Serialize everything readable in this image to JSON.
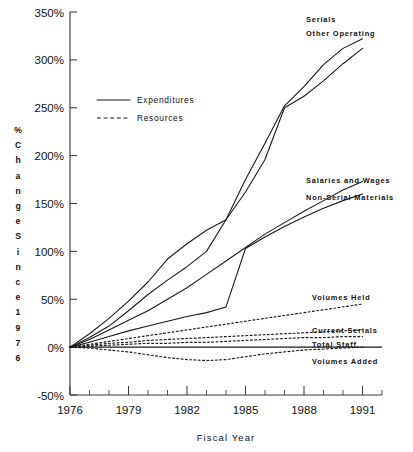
{
  "chart_data": {
    "type": "line",
    "title": "",
    "xlabel": "Fiscal Year",
    "ylabel": "% Change Since 1976",
    "ylabel_chars": [
      "%",
      "C",
      "h",
      "a",
      "n",
      "g",
      "e",
      "S",
      "i",
      "n",
      "c",
      "e",
      "1",
      "9",
      "7",
      "6"
    ],
    "x": [
      1976,
      1977,
      1978,
      1979,
      1980,
      1981,
      1982,
      1983,
      1984,
      1985,
      1986,
      1987,
      1988,
      1989,
      1990,
      1991
    ],
    "xlim": [
      1976,
      1992
    ],
    "ylim": [
      -50,
      350
    ],
    "yticks": [
      -50,
      0,
      50,
      100,
      150,
      200,
      250,
      300,
      350
    ],
    "ytick_labels": [
      "-50%",
      "0%",
      "50%",
      "100%",
      "150%",
      "200%",
      "250%",
      "300%",
      "350%"
    ],
    "xticks": [
      1976,
      1977,
      1978,
      1979,
      1980,
      1981,
      1982,
      1983,
      1984,
      1985,
      1986,
      1987,
      1988,
      1989,
      1990,
      1991,
      1992
    ],
    "xtick_labels_shown": [
      "1976",
      "1979",
      "1982",
      "1985",
      "1988",
      "1991"
    ],
    "xtick_labels_values": [
      1976,
      1979,
      1982,
      1985,
      1988,
      1991
    ],
    "grid": false,
    "legend_position": "upper-left-inside",
    "legend": [
      {
        "label": "Expenditures",
        "style": "solid"
      },
      {
        "label": "Resources",
        "style": "dashed"
      }
    ],
    "series": [
      {
        "name": "Serials",
        "style": "solid",
        "group": "Expenditures",
        "values": [
          0,
          14,
          30,
          48,
          68,
          92,
          108,
          122,
          133,
          175,
          213,
          252,
          272,
          295,
          312,
          322
        ]
      },
      {
        "name": "Other Operating",
        "style": "solid",
        "group": "Expenditures",
        "values": [
          0,
          10,
          22,
          38,
          55,
          70,
          84,
          100,
          133,
          162,
          196,
          250,
          262,
          278,
          296,
          312
        ]
      },
      {
        "name": "Salaries and Wages",
        "style": "solid",
        "group": "Expenditures",
        "values": [
          0,
          8,
          18,
          28,
          38,
          50,
          62,
          76,
          90,
          104,
          118,
          130,
          142,
          153,
          164,
          173
        ]
      },
      {
        "name": "Non-Serial Materials",
        "style": "solid",
        "group": "Expenditures",
        "values": [
          0,
          5,
          11,
          17,
          22,
          27,
          32,
          36,
          42,
          103,
          115,
          126,
          136,
          145,
          153,
          160
        ]
      },
      {
        "name": "Volumes Held",
        "style": "dotted",
        "group": "Resources",
        "values": [
          0,
          3,
          6,
          9,
          12,
          15,
          18,
          21,
          24,
          27,
          30,
          33,
          36,
          39,
          42,
          45
        ]
      },
      {
        "name": "Current Serials",
        "style": "dotted",
        "group": "Resources",
        "values": [
          0,
          2,
          4,
          5,
          7,
          8,
          9,
          10,
          11,
          12,
          13,
          14,
          15,
          16,
          17,
          18
        ]
      },
      {
        "name": "Total Staff",
        "style": "dotted",
        "group": "Resources",
        "values": [
          0,
          1,
          2,
          3,
          4,
          4,
          5,
          5,
          6,
          7,
          8,
          9,
          10,
          10,
          11,
          11
        ]
      },
      {
        "name": "Volumes Added",
        "style": "dotted",
        "group": "Resources",
        "values": [
          0,
          -1,
          -3,
          -5,
          -8,
          -11,
          -13,
          -14,
          -13,
          -10,
          -7,
          -5,
          -3,
          -2,
          -1,
          0
        ]
      }
    ],
    "series_labels": [
      {
        "name": "Serials",
        "x": 306,
        "y": 22
      },
      {
        "name": "Other Operating",
        "x": 306,
        "y": 36
      },
      {
        "name": "Salaries and Wages",
        "x": 306,
        "y": 183
      },
      {
        "name": "Non-Serial Materials",
        "x": 306,
        "y": 200
      },
      {
        "name": "Volumes Held",
        "x": 312,
        "y": 300
      },
      {
        "name": "Current Serials",
        "x": 312,
        "y": 333
      },
      {
        "name": "Total Staff",
        "x": 312,
        "y": 347
      },
      {
        "name": "Volumes Added",
        "x": 312,
        "y": 364
      }
    ],
    "colors": {
      "line": "#1a1a1a",
      "axis": "#3a3a3a",
      "background": "#ffffff"
    }
  }
}
